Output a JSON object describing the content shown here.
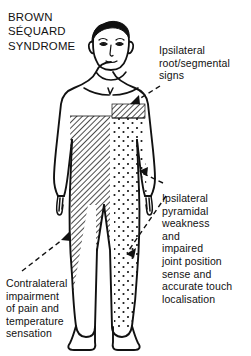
{
  "document": {
    "title_lines": "BROWN\nSÉQUARD\nSYNDROME",
    "background_color": "#ffffff",
    "ink_color": "#111111"
  },
  "annotations": {
    "root_segmental": {
      "text": "Ipsilateral\nroot/segmental\nsigns",
      "points_to": "hatched-band-shoulder"
    },
    "pyramidal": {
      "text": "Ipsilateral\npyramidal\nweakness\nand\nimpaired\njoint position\nsense and\naccurate touch\nlocalisation",
      "points_to": "stippled-region-right-side"
    },
    "contralateral": {
      "text": "Contralateral\nimpairment\nof pain and\ntemperature\nsensation",
      "points_to": "hatched-region-left-side"
    }
  },
  "figure": {
    "name": "anterior-human-body-line-drawing",
    "shading": {
      "hatched_label": "diagonal hatching",
      "stippled_label": "dot stipple",
      "hatched_side": "figure-left",
      "stippled_side": "figure-right"
    }
  }
}
